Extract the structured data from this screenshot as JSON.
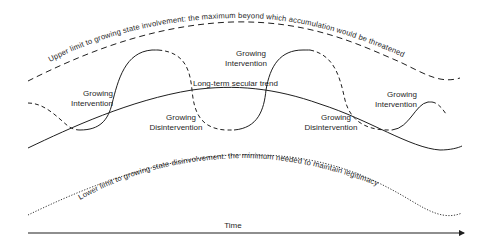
{
  "diagram": {
    "type": "conceptual-cycle-diagram",
    "axis": {
      "x_label": "Time",
      "arrow": true
    },
    "upper_limit": {
      "label": "Upper limit to growing state involvement: the maximum beyond which accumulation would be threatened",
      "style": "dashed"
    },
    "lower_limit": {
      "label": "Lower limit to growing state disinvolvement: the minimum needed to maintain legitimacy",
      "style": "dotted"
    },
    "trend": {
      "label": "Long-term secular trend",
      "style": "solid"
    },
    "phases": [
      {
        "id": "gi1",
        "line1": "Growing",
        "line2": "Intervention"
      },
      {
        "id": "gd1",
        "line1": "Growing",
        "line2": "Disintervention"
      },
      {
        "id": "gi2",
        "line1": "Growing",
        "line2": "Intervention"
      },
      {
        "id": "gd2",
        "line1": "Growing",
        "line2": "Disintervention"
      },
      {
        "id": "gi3",
        "line1": "Growing",
        "line2": "Intervention"
      }
    ],
    "colors": {
      "ink": "#1f1f1f",
      "background": "#ffffff"
    }
  }
}
